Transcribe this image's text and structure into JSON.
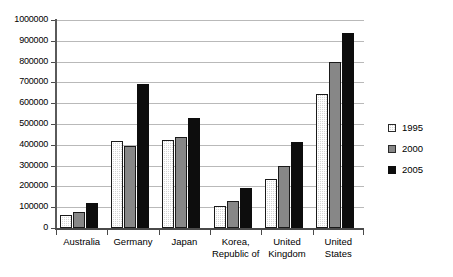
{
  "chart_data": {
    "type": "bar",
    "title": "",
    "subtitle": "",
    "xlabel": "",
    "ylabel": "",
    "ylim": [
      0,
      1000000
    ],
    "y_tick_step": 100000,
    "y_ticks": [
      "0",
      "100000",
      "200000",
      "300000",
      "400000",
      "500000",
      "600000",
      "700000",
      "800000",
      "900000",
      "1000000"
    ],
    "grid": "horizontal",
    "legend_position": "right",
    "categories": [
      "Australia",
      "Germany",
      "Japan",
      "Korea,\nRepublic of",
      "United\nKingdom",
      "United\nStates"
    ],
    "series": [
      {
        "name": "1995",
        "color": "#d6d6d6",
        "values": [
          62000,
          420000,
          425000,
          107000,
          238000,
          645000
        ]
      },
      {
        "name": "2000",
        "color": "#878787",
        "values": [
          75000,
          393000,
          437000,
          128000,
          298000,
          800000
        ]
      },
      {
        "name": "2005",
        "color": "#0d0d0d",
        "values": [
          122000,
          690000,
          530000,
          193000,
          415000,
          938000
        ]
      }
    ]
  },
  "legend": {
    "items": [
      {
        "label": "1995",
        "swatch_class": "s1995"
      },
      {
        "label": "2000",
        "swatch_class": "s2000"
      },
      {
        "label": "2005",
        "swatch_class": "s2005"
      }
    ]
  }
}
